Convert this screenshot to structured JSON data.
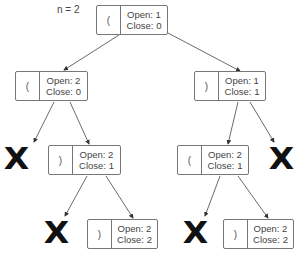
{
  "title": "n = 2",
  "nodes": {
    "root": {
      "char": "(",
      "open": "Open: 1",
      "close": "Close: 0"
    },
    "l1_left": {
      "char": "(",
      "open": "Open: 2",
      "close": "Close: 0"
    },
    "l1_right": {
      "char": ")",
      "open": "Open: 1",
      "close": "Close: 1"
    },
    "l2_left": {
      "char": ")",
      "open": "Open: 2",
      "close": "Close: 1"
    },
    "l2_right": {
      "char": "(",
      "open": "Open: 2",
      "close": "Close: 1"
    },
    "l3_left": {
      "char": ")",
      "open": "Open: 2",
      "close": "Close: 2"
    },
    "l3_right": {
      "char": ")",
      "open": "Open: 2",
      "close": "Close: 2"
    }
  },
  "pruned_marker": "X",
  "caption": "",
  "colors": {
    "border": "#777777",
    "arrow": "#333333",
    "x_mark": "#111111"
  }
}
